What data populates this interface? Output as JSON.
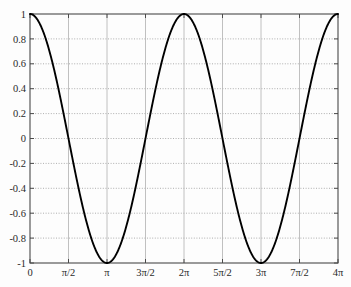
{
  "chart_data": {
    "type": "line",
    "title": "",
    "subtitle": "",
    "xlabel": "",
    "ylabel": "",
    "function": "y = cos(x)",
    "xlim": [
      0,
      12.566370614359172
    ],
    "ylim": [
      -1,
      1
    ],
    "grid": true,
    "legend": null,
    "legend_position": "none",
    "line_color": "#000000",
    "grid_color": "#9a9a9a",
    "axis_color": "#4a4a4a",
    "background_color": "#fdfdfd",
    "xticks": [
      {
        "value": 0,
        "label": "0"
      },
      {
        "value": 1.5707963267948966,
        "label": "π/2"
      },
      {
        "value": 3.141592653589793,
        "label": "π"
      },
      {
        "value": 4.71238898038469,
        "label": "3π/2"
      },
      {
        "value": 6.283185307179586,
        "label": "2π"
      },
      {
        "value": 7.853981633974483,
        "label": "5π/2"
      },
      {
        "value": 9.42477796076938,
        "label": "3π"
      },
      {
        "value": 10.995574287564276,
        "label": "7π/2"
      },
      {
        "value": 12.566370614359172,
        "label": "4π"
      }
    ],
    "yticks": [
      {
        "value": 1,
        "label": "1"
      },
      {
        "value": 0.8,
        "label": "0.8"
      },
      {
        "value": 0.6,
        "label": "0.6"
      },
      {
        "value": 0.4,
        "label": "0.4"
      },
      {
        "value": 0.2,
        "label": "0.2"
      },
      {
        "value": 0,
        "label": "0"
      },
      {
        "value": -0.2,
        "label": "-0.2"
      },
      {
        "value": -0.4,
        "label": "-0.4"
      },
      {
        "value": -0.6,
        "label": "-0.6"
      },
      {
        "value": -0.8,
        "label": "-0.8"
      },
      {
        "value": -1,
        "label": "-1"
      }
    ],
    "series": [
      {
        "name": "cos(x)",
        "key_points": [
          {
            "x": 0,
            "y": 1
          },
          {
            "x": 1.5707963267948966,
            "y": 0
          },
          {
            "x": 3.141592653589793,
            "y": -1
          },
          {
            "x": 4.71238898038469,
            "y": 0
          },
          {
            "x": 6.283185307179586,
            "y": 1
          },
          {
            "x": 7.853981633974483,
            "y": 0
          },
          {
            "x": 9.42477796076938,
            "y": -1
          },
          {
            "x": 10.995574287564276,
            "y": 0
          },
          {
            "x": 12.566370614359172,
            "y": 1
          }
        ]
      }
    ]
  },
  "layout": {
    "plot_left": 30,
    "plot_top": 14,
    "plot_right": 338,
    "plot_bottom": 263
  }
}
